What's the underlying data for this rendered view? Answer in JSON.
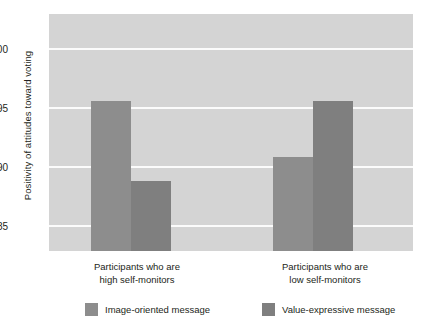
{
  "chart_data": {
    "type": "bar",
    "title": "",
    "xlabel": "",
    "ylabel": "Positivity of attitudes toward voting",
    "categories": [
      "Participants who are high self-monitors",
      "Participants who are low self-monitors"
    ],
    "category_lines": [
      [
        "Participants who are",
        "high self-monitors"
      ],
      [
        "Participants who are",
        "low self-monitors"
      ]
    ],
    "series": [
      {
        "name": "Image-oriented message",
        "values": [
          95.6,
          90.9
        ],
        "color": "#8d8d8d"
      },
      {
        "name": "Value-expressive message",
        "values": [
          88.8,
          95.6
        ],
        "color": "#7f7f7f"
      }
    ],
    "ylim": [
      82.9,
      103.0
    ],
    "yticks": [
      85,
      90,
      95,
      100
    ],
    "ytick_labels": [
      "85",
      "90",
      "95",
      "100"
    ],
    "grid": true,
    "gridline_color": "#fbfbfb",
    "plot_background": "#d4d4d4",
    "legend_position": "bottom"
  },
  "legend": {
    "items": [
      {
        "label": "Image-oriented message",
        "color": "#8d8d8d"
      },
      {
        "label": "Value-expressive message",
        "color": "#7f7f7f"
      }
    ]
  },
  "axes": {
    "y_title": "Positivity of attitudes toward voting",
    "y_tick_100": "100",
    "y_tick_95": "95",
    "y_tick_90": "90",
    "y_tick_85": "85"
  },
  "x_labels": {
    "group1_line1": "Participants who are",
    "group1_line2": "high self-monitors",
    "group2_line1": "Participants who are",
    "group2_line2": "low self-monitors"
  }
}
